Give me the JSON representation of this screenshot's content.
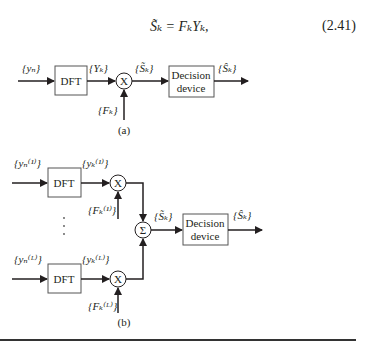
{
  "equation": {
    "text": "S̃ₖ = FₖYₖ,",
    "number": "(2.41)"
  },
  "diagram_a": {
    "input_label": "{yₙ}",
    "dft_label": "DFT",
    "dft_output_label": "{Yₖ}",
    "multiplier_symbol": "X",
    "weight_label": "{Fₖ}",
    "combined_label": "{S̃ₖ}",
    "decision_label_line1": "Decision",
    "decision_label_line2": "device",
    "output_label": "{Ŝₖ}",
    "caption": "(a)"
  },
  "diagram_b": {
    "branch1": {
      "input_label": "{yₙ⁽¹⁾}",
      "dft_label": "DFT",
      "dft_output_label": "{yₖ⁽¹⁾}",
      "multiplier_symbol": "X",
      "weight_label": "{Fₖ⁽¹⁾}"
    },
    "ellipsis": "⋮",
    "branchL": {
      "input_label": "{yₙ⁽ᴸ⁾}",
      "dft_label": "DFT",
      "dft_output_label": "{yₖ⁽ᴸ⁾}",
      "multiplier_symbol": "X",
      "weight_label": "{Fₖ⁽ᴸ⁾}"
    },
    "sum_symbol": "Σ",
    "combined_label": "{S̃ₖ}",
    "decision_label_line1": "Decision",
    "decision_label_line2": "device",
    "output_label": "{Ŝₖ}",
    "caption": "(b)"
  }
}
